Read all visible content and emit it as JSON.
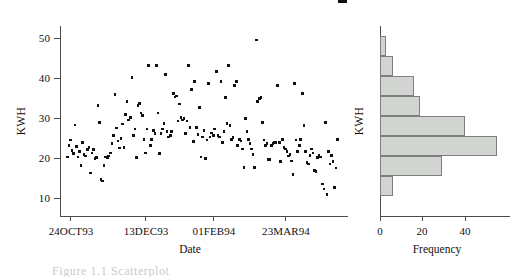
{
  "figure": {
    "caption_partial": "Figure 1.1  Scatterplot"
  },
  "chart_data": [
    {
      "type": "scatter",
      "panel": "left",
      "title": "",
      "xlabel": "Date",
      "ylabel": "KWH",
      "ylim": [
        5,
        54
      ],
      "yticks": [
        10,
        20,
        30,
        40,
        50
      ],
      "ytick_labels": [
        "10",
        "20",
        "30",
        "40",
        "50"
      ],
      "xtick_labels": [
        "24OCT93",
        "13DEC93",
        "01FEB94",
        "23MAR94"
      ],
      "xtick_positions_index": [
        8,
        58,
        102,
        150
      ],
      "grid": false,
      "legend": "none",
      "n_points": 182,
      "x": [
        0,
        1,
        2,
        3,
        4,
        5,
        6,
        7,
        8,
        9,
        10,
        11,
        12,
        13,
        14,
        15,
        16,
        17,
        18,
        19,
        20,
        21,
        22,
        23,
        24,
        25,
        26,
        27,
        28,
        29,
        30,
        31,
        32,
        33,
        34,
        35,
        36,
        37,
        38,
        39,
        40,
        41,
        42,
        43,
        44,
        45,
        46,
        47,
        48,
        49,
        50,
        51,
        52,
        53,
        54,
        55,
        56,
        57,
        58,
        59,
        60,
        61,
        62,
        63,
        64,
        65,
        66,
        67,
        68,
        69,
        70,
        71,
        72,
        73,
        74,
        75,
        76,
        77,
        78,
        79,
        80,
        81,
        82,
        83,
        84,
        85,
        86,
        87,
        88,
        89,
        90,
        91,
        92,
        93,
        94,
        95,
        96,
        97,
        98,
        99,
        100,
        101,
        102,
        103,
        104,
        105,
        106,
        107,
        108,
        109,
        110,
        111,
        112,
        113,
        114,
        115,
        116,
        117,
        118,
        119,
        120,
        121,
        122,
        123,
        124,
        125,
        126,
        127,
        128,
        129,
        130,
        131,
        132,
        133,
        134,
        135,
        136,
        137,
        138,
        139,
        140,
        141,
        142,
        143,
        144,
        145,
        146,
        147,
        148,
        149,
        150,
        151,
        152,
        153,
        154,
        155,
        156,
        157,
        158,
        159,
        160,
        161,
        162,
        163,
        164,
        165,
        166,
        167,
        168,
        169,
        170,
        171,
        172,
        173,
        174,
        175,
        176,
        177,
        178,
        179,
        180,
        181
      ],
      "y": [
        20.6,
        23.4,
        24.8,
        22.2,
        21.4,
        28.6,
        23.2,
        20.6,
        22.0,
        18.4,
        24.2,
        21.2,
        20.8,
        22.4,
        23.0,
        16.6,
        21.6,
        22.4,
        20.2,
        20.4,
        33.4,
        29.2,
        15.0,
        14.6,
        18.4,
        20.6,
        20.4,
        20.8,
        21.6,
        24.0,
        26.0,
        36.2,
        27.8,
        24.6,
        22.8,
        25.2,
        28.8,
        23.0,
        31.2,
        34.4,
        29.8,
        30.4,
        40.4,
        26.0,
        27.6,
        20.4,
        33.4,
        34.0,
        31.6,
        31.0,
        25.0,
        21.6,
        27.6,
        43.4,
        23.4,
        25.0,
        27.2,
        26.4,
        43.4,
        31.6,
        21.4,
        26.4,
        27.6,
        29.0,
        41.2,
        27.0,
        25.6,
        26.0,
        27.0,
        36.4,
        35.6,
        35.8,
        29.6,
        33.8,
        30.4,
        29.8,
        30.2,
        26.4,
        29.6,
        43.4,
        28.0,
        37.4,
        24.4,
        39.4,
        28.0,
        26.2,
        33.0,
        20.6,
        25.6,
        27.2,
        20.2,
        24.8,
        39.0,
        25.6,
        26.6,
        26.0,
        27.6,
        42.0,
        26.0,
        25.6,
        39.4,
        24.2,
        27.0,
        35.4,
        29.0,
        43.4,
        28.4,
        25.0,
        25.4,
        38.4,
        39.4,
        23.4,
        25.0,
        24.6,
        22.6,
        18.0,
        30.2,
        27.0,
        25.0,
        24.0,
        22.6,
        21.2,
        18.0,
        49.8,
        34.4,
        35.2,
        35.4,
        29.2,
        24.8,
        23.4,
        24.0,
        20.0,
        20.0,
        23.4,
        24.0,
        24.2,
        24.2,
        38.4,
        24.2,
        19.4,
        25.0,
        23.0,
        22.6,
        22.0,
        20.8,
        21.2,
        19.6,
        16.2,
        39.0,
        24.8,
        22.0,
        23.4,
        25.0,
        36.4,
        28.4,
        22.0,
        19.2,
        18.8,
        21.0,
        22.6,
        21.6,
        17.2,
        17.0,
        20.4,
        21.0,
        20.6,
        13.8,
        12.6,
        29.2,
        11.2,
        22.0,
        18.8,
        21.0,
        19.4,
        13.0,
        17.8,
        25.0
      ],
      "y_outliers_at_50": [
        49.8,
        49.9,
        50.0
      ],
      "note": "Daily electricity consumption (KWH) rises from ~22 in late Oct 1993 to a mid-winter peak near 50 and declines toward ~18 by spring 1994."
    },
    {
      "type": "bar",
      "orientation": "horizontal",
      "panel": "right",
      "title": "",
      "xlabel": "Frequency",
      "ylabel": "KWH",
      "xlim": [
        0,
        57
      ],
      "xticks": [
        0,
        20,
        40
      ],
      "xtick_labels": [
        "0",
        "20",
        "40"
      ],
      "grid": false,
      "legend": "none",
      "categories": [
        "bin8",
        "bin7",
        "bin6",
        "bin5",
        "bin4",
        "bin3",
        "bin2",
        "bin1"
      ],
      "values": [
        3,
        6,
        16,
        19,
        40,
        55,
        29,
        6
      ],
      "bar_fill": "#d2d4d2",
      "bar_edge": "#7d807d",
      "note": "Distribution of KWH values; modal bin has frequency 55, right-skewed toward higher KWH."
    }
  ],
  "axes": {
    "scatter": {
      "ylabel": "KWH",
      "xlabel": "Date",
      "ytick_labels": [
        "50",
        "40",
        "30",
        "20",
        "10"
      ],
      "xtick_labels": [
        "24OCT93",
        "13DEC93",
        "01FEB94",
        "23MAR94"
      ]
    },
    "histogram": {
      "ylabel": "KWH",
      "xlabel": "Frequency",
      "xtick_labels": [
        "0",
        "20",
        "40"
      ]
    }
  },
  "colors": {
    "axis": "#4a4a4a",
    "marker": "#111111",
    "bar_fill": "#d2d4d2",
    "bar_edge": "#7d807d",
    "background": "#ffffff"
  }
}
